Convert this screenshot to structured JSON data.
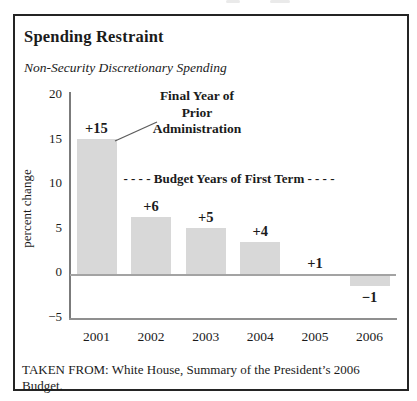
{
  "figure": {
    "title": "Spending Restraint",
    "subtitle": "Non-Security Discretionary Spending",
    "caption": "TAKEN FROM: White House, Summary of the President’s 2006 Budget."
  },
  "chart_data": {
    "type": "bar",
    "title": "Spending Restraint",
    "subtitle": "Non-Security Discretionary Spending",
    "xlabel": "",
    "ylabel": "percent change",
    "categories": [
      "2001",
      "2002",
      "2003",
      "2004",
      "2005",
      "2006"
    ],
    "values": [
      15,
      6,
      5,
      4,
      1,
      -1
    ],
    "bar_labels": [
      "+15",
      "+6",
      "+5",
      "+4",
      "+1",
      "−1"
    ],
    "drawn_bar_units": [
      15.2,
      6.4,
      5.2,
      3.6,
      0,
      -1.2
    ],
    "ylim": [
      -5,
      20
    ],
    "yticks": [
      20,
      15,
      10,
      5,
      0,
      -5
    ],
    "ytick_labels": [
      "20",
      "15",
      "10",
      "5",
      "0",
      "−5"
    ],
    "grid": false,
    "legend": "none",
    "bar_color": "#d8d8d8",
    "annotations": {
      "final_year": {
        "lines": [
          "Final Year of",
          "Prior",
          "Administration"
        ],
        "target": "top of 2001 bar"
      },
      "budget_years": "- - - -  Budget Years of First Term - - - -"
    }
  }
}
